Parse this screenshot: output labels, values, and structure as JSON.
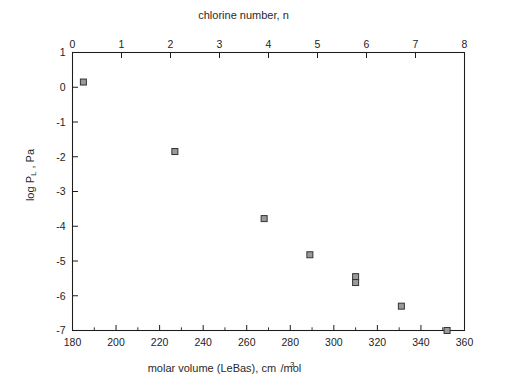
{
  "chart_data": {
    "type": "scatter",
    "title": "",
    "xlabel": "molar volume (LeBas), cm3/mol",
    "ylabel": "log PL , Pa",
    "top_axis_label": "chlorine number, n",
    "xlim": [
      180,
      360
    ],
    "ylim": [
      -7,
      1
    ],
    "top_xlim": [
      0,
      8
    ],
    "grid": false,
    "legend": null,
    "x_ticks": [
      180,
      200,
      220,
      240,
      260,
      280,
      300,
      320,
      340,
      360
    ],
    "x_tick_labels": [
      "180",
      "200",
      "220",
      "240",
      "260",
      "280",
      "300",
      "320",
      "340",
      "360"
    ],
    "x_minor_ticks": [
      190,
      210,
      230,
      250,
      270,
      290,
      310,
      330,
      350
    ],
    "y_ticks": [
      1,
      0,
      -1,
      -2,
      -3,
      -4,
      -5,
      -6,
      -7
    ],
    "y_tick_labels": [
      "1",
      "0",
      "-1",
      "-2",
      "-3",
      "-4",
      "-5",
      "-6",
      "-7"
    ],
    "top_ticks": [
      0,
      1,
      2,
      3,
      4,
      5,
      6,
      7,
      8
    ],
    "top_tick_labels": [
      "0",
      "1",
      "2",
      "3",
      "4",
      "5",
      "6",
      "7",
      "8"
    ],
    "marker": "square",
    "marker_fill": "#9a9a9a",
    "marker_edge": "#333333",
    "x": [
      185,
      227,
      268,
      289,
      310,
      310,
      331,
      352
    ],
    "y": [
      0.15,
      -1.85,
      -3.78,
      -4.82,
      -5.45,
      -5.62,
      -6.3,
      -7.0
    ],
    "points": [
      {
        "x": 185,
        "y": 0.15,
        "n": 0
      },
      {
        "x": 227,
        "y": -1.85,
        "n": 1
      },
      {
        "x": 268,
        "y": -3.78,
        "n": 2
      },
      {
        "x": 289,
        "y": -4.82,
        "n": 3
      },
      {
        "x": 310,
        "y": -5.45,
        "n": 4
      },
      {
        "x": 310,
        "y": -5.62,
        "n": 4
      },
      {
        "x": 331,
        "y": -6.3,
        "n": 5
      },
      {
        "x": 352,
        "y": -7.0,
        "n": 6
      }
    ]
  },
  "axes": {
    "top_title": "chlorine number, n",
    "x_title_main": "molar volume (LeBas), cm",
    "x_title_sup": "3",
    "x_title_tail": "/mol",
    "y_title_main": "log P",
    "y_title_sub": "L",
    "y_title_tail": " , Pa"
  },
  "colors": {
    "background": "#ffffff",
    "axis": "#1d1d1d",
    "marker_fill": "#9a9a9a",
    "marker_edge": "#333333",
    "text": "#1d1d1d"
  }
}
